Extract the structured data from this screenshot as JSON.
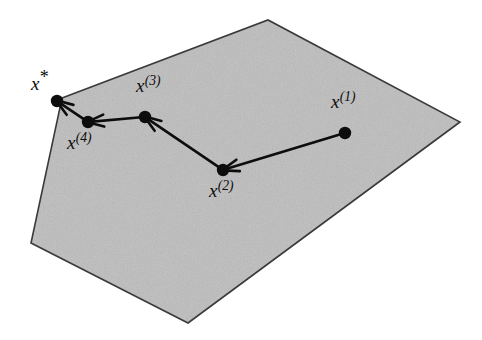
{
  "figure": {
    "canvas": {
      "width": 482,
      "height": 340
    },
    "background_color": "#ffffff",
    "region": {
      "name": "feasible-region-polygon",
      "fill_color": "#e9e9e9",
      "speckle_color": "#bdbdbd",
      "stroke_color": "#3a3a3a",
      "stroke_width": 1.6,
      "vertices": [
        {
          "x": 62,
          "y": 98
        },
        {
          "x": 268,
          "y": 20
        },
        {
          "x": 460,
          "y": 122
        },
        {
          "x": 188,
          "y": 323
        },
        {
          "x": 31,
          "y": 243
        }
      ]
    },
    "point_style": {
      "fill_color": "#0d0d0d",
      "radius": 6.2
    },
    "arrow_style": {
      "stroke_color": "#0d0d0d",
      "stroke_width": 2.6,
      "head_length": 17,
      "head_half_width": 6
    },
    "points": [
      {
        "id": "x1",
        "label_text": "x",
        "label_sup": "(1)",
        "label_plain": "x(1)",
        "x": 345,
        "y": 133,
        "label_x": 331,
        "label_y": 92
      },
      {
        "id": "x2",
        "label_text": "x",
        "label_sup": "(2)",
        "label_plain": "x(2)",
        "x": 223,
        "y": 170,
        "label_x": 209,
        "label_y": 181
      },
      {
        "id": "x3",
        "label_text": "x",
        "label_sup": "(3)",
        "label_plain": "x(3)",
        "x": 145,
        "y": 117,
        "label_x": 136,
        "label_y": 76
      },
      {
        "id": "x4",
        "label_text": "x",
        "label_sup": "(4)",
        "label_plain": "x(4)",
        "x": 88,
        "y": 122,
        "label_x": 67,
        "label_y": 133
      },
      {
        "id": "xstar",
        "label_text": "x",
        "label_sup": "*",
        "label_plain": "x*",
        "x": 57,
        "y": 101,
        "label_x": 31,
        "label_y": 74
      }
    ],
    "arrows": [
      {
        "id": "arrow-x1-x2",
        "from": "x1",
        "to": "x2"
      },
      {
        "id": "arrow-x2-x3",
        "from": "x2",
        "to": "x3"
      },
      {
        "id": "arrow-x3-x4",
        "from": "x3",
        "to": "x4"
      },
      {
        "id": "arrow-x4-xstar",
        "from": "x4",
        "to": "xstar"
      }
    ]
  }
}
